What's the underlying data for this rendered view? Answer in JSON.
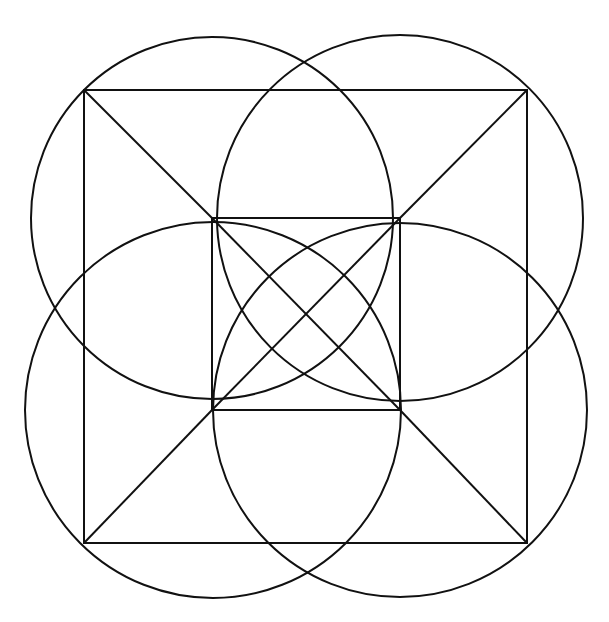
{
  "diagram": {
    "title": "",
    "stroke_color": "#111111",
    "background": "#ffffff",
    "outer_square": {
      "x1": 84,
      "y1": 90,
      "x2": 527,
      "y2": 543
    },
    "inner_square": {
      "x1": 212,
      "y1": 218,
      "x2": 400,
      "y2": 410
    },
    "circles": [
      {
        "name": "top-left",
        "cx": 212,
        "cy": 218,
        "r": 181
      },
      {
        "name": "top-right",
        "cx": 400,
        "cy": 218,
        "r": 183
      },
      {
        "name": "bottom-left",
        "cx": 213,
        "cy": 410,
        "r": 188
      },
      {
        "name": "bottom-right",
        "cx": 400,
        "cy": 410,
        "r": 187
      }
    ],
    "diagonals": [
      {
        "name": "outer-tl-to-inner-tl",
        "x1": 84,
        "y1": 90,
        "x2": 212,
        "y2": 218
      },
      {
        "name": "outer-tr-to-inner-tr",
        "x1": 527,
        "y1": 90,
        "x2": 400,
        "y2": 218
      },
      {
        "name": "outer-bl-to-inner-bl",
        "x1": 84,
        "y1": 543,
        "x2": 212,
        "y2": 410
      },
      {
        "name": "outer-br-to-inner-br",
        "x1": 527,
        "y1": 543,
        "x2": 400,
        "y2": 410
      },
      {
        "name": "inner-diag-tl-br",
        "x1": 212,
        "y1": 218,
        "x2": 400,
        "y2": 410
      },
      {
        "name": "inner-diag-tr-bl",
        "x1": 400,
        "y1": 218,
        "x2": 212,
        "y2": 410
      }
    ]
  }
}
